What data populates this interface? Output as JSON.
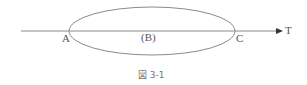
{
  "diagram": {
    "labels": {
      "a": "A",
      "b": "(B)",
      "c": "C",
      "t": "T"
    },
    "caption": "図 3-1",
    "colors": {
      "stroke": "#8a8a8a",
      "arrow": "#333333",
      "text": "#555555"
    }
  }
}
